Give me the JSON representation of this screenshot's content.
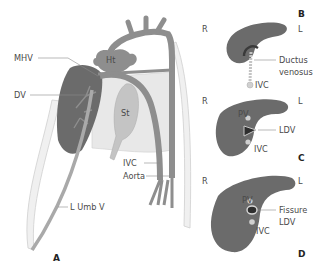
{
  "figure": {
    "panels": [
      {
        "id": "A",
        "label": "A",
        "labels": {
          "mhv": "MHV",
          "dv": "DV",
          "ht": "Ht",
          "st": "St",
          "ivc": "IVC",
          "aorta": "Aorta",
          "lumbv": "L Umb V"
        }
      },
      {
        "id": "B",
        "label": "B",
        "right": "R",
        "left": "L",
        "labels": {
          "ductus1": "Ductus",
          "ductus2": "venosus",
          "ivc": "IVC"
        }
      },
      {
        "id": "C",
        "label": "C",
        "right": "R",
        "left": "L",
        "labels": {
          "pv": "PV",
          "ldv": "LDV",
          "ivc": "IVC"
        }
      },
      {
        "id": "D",
        "label": "D",
        "right": "R",
        "left": "L",
        "labels": {
          "pv": "PV",
          "fissure": "Fissure",
          "ldv": "LDV",
          "ivc": "IVC"
        }
      }
    ],
    "colors": {
      "liver": "#6b6b6b",
      "vessel": "#8e8e8e",
      "light_fill": "#e6e6e6",
      "stomach": "#bdbdbd",
      "umbilical": "#a9a9a9",
      "outline": "#c8c8c8",
      "dark_core": "#2e2e2e",
      "leader": "#8a8a8a"
    }
  }
}
